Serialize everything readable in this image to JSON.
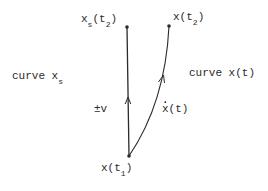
{
  "diagram": {
    "type": "trajectory-comparison",
    "colors": {
      "ink": "#2a2a2a",
      "background": "#ffffff"
    },
    "points": {
      "start": {
        "label": "x(t",
        "sub": "1",
        "close": ")",
        "x": 129,
        "y": 156
      },
      "end_s": {
        "label": "x",
        "sub": "s",
        "label2": "(t",
        "sub2": "2",
        "close": ")",
        "x": 127,
        "y": 27
      },
      "end_x": {
        "label": "x(t",
        "sub": "2",
        "close": ")",
        "x": 169,
        "y": 26
      }
    },
    "curves": {
      "xs": {
        "label": "curve x",
        "sub": "s",
        "arrow_label": "±v"
      },
      "xt": {
        "label": "curve x(t)",
        "arrow_label": "x(t)",
        "arrow_label_dot": "˙"
      }
    }
  }
}
